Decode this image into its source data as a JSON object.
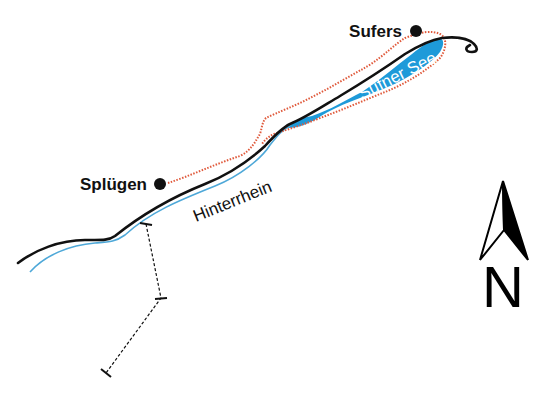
{
  "map": {
    "places": [
      {
        "name": "Sufers",
        "type": "town"
      },
      {
        "name": "Splügen",
        "type": "town"
      }
    ],
    "water": [
      {
        "name": "Sufner See",
        "type": "lake"
      },
      {
        "name": "Hinterrhein",
        "type": "river"
      }
    ],
    "north_arrow": {
      "letter": "N"
    },
    "colors": {
      "lake": "#1e9ad9",
      "river": "#4ea8d8",
      "road": "#111111",
      "trail": "#e05a3c",
      "background": "#ffffff"
    }
  }
}
